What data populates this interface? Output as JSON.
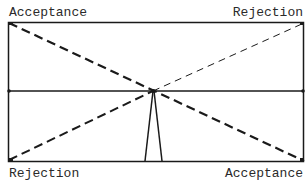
{
  "diagram": {
    "labels": {
      "top_left": "Acceptance",
      "top_right": "Rejection",
      "bottom_left": "Rejection",
      "bottom_right": "Acceptance"
    },
    "colors": {
      "line": "#1a1a1a",
      "background": "#ffffff"
    },
    "geometry": {
      "rect": {
        "x1": 8,
        "y1": 22,
        "x2": 304,
        "y2": 161
      },
      "midline_y": 91,
      "center": {
        "x": 153,
        "y": 91
      },
      "triangle_base": {
        "x1": 145,
        "x2": 162,
        "y": 161
      }
    }
  }
}
